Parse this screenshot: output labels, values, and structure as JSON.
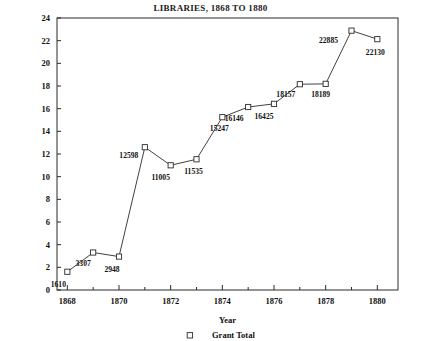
{
  "chart_data": {
    "type": "line",
    "title": "LIBRARIES, 1868 TO 1880",
    "xlabel": "Year",
    "ylabel": "",
    "xlim": [
      1867.6,
      1880.8
    ],
    "ylim": [
      0,
      24
    ],
    "grid": false,
    "legend_position": "bottom",
    "legend": [
      "Grant Total"
    ],
    "y_unit_note": "thousands",
    "x": [
      1868,
      1869,
      1870,
      1871,
      1872,
      1873,
      1874,
      1875,
      1876,
      1877,
      1878,
      1879,
      1880
    ],
    "values": [
      1.61,
      3.307,
      2.948,
      12.598,
      11.005,
      11.535,
      15.247,
      16.146,
      16.425,
      18.157,
      18.189,
      22.885,
      22.13
    ],
    "point_labels": [
      "1610",
      "3307",
      "2948",
      "12598",
      "11005",
      "11535",
      "15247",
      "16146",
      "16425",
      "18157",
      "18189",
      "22885",
      "22130"
    ],
    "xticks": [
      1868,
      1870,
      1872,
      1874,
      1876,
      1878,
      1880
    ],
    "xtick_labels": [
      "1868",
      "1870",
      "1872",
      "1874",
      "1876",
      "1878",
      "1880"
    ],
    "xminor_ticks": [
      1869,
      1871,
      1873,
      1875,
      1877,
      1879
    ],
    "yticks": [
      0,
      2,
      4,
      6,
      8,
      10,
      12,
      14,
      16,
      18,
      20,
      22,
      24
    ],
    "ytick_labels": [
      "0",
      "2",
      "4",
      "6",
      "8",
      "10",
      "12",
      "14",
      "16",
      "18",
      "20",
      "22",
      "24"
    ],
    "series_name": "Grant Total",
    "marker": "open-square",
    "line_color": "#2b2b2b",
    "marker_color": "#2b2b2b",
    "axis_color": "#2b2b2b"
  },
  "label_offsets": [
    {
      "dx": -9,
      "dy": 15
    },
    {
      "dx": -10,
      "dy": 13
    },
    {
      "dx": -7,
      "dy": 15
    },
    {
      "dx": -16,
      "dy": 11
    },
    {
      "dx": -10,
      "dy": 15
    },
    {
      "dx": -3,
      "dy": 15
    },
    {
      "dx": -3,
      "dy": 14
    },
    {
      "dx": -14,
      "dy": 14
    },
    {
      "dx": -10,
      "dy": 15
    },
    {
      "dx": -14,
      "dy": 13
    },
    {
      "dx": -5,
      "dy": 13
    },
    {
      "dx": -23,
      "dy": 12
    },
    {
      "dx": -2,
      "dy": 16
    }
  ]
}
